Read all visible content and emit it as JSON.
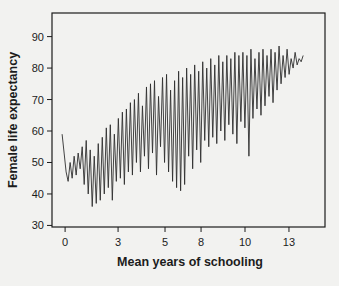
{
  "page": {
    "background": "#f2f2f0",
    "text_color": "#1c1c1c"
  },
  "chart_data": {
    "type": "line",
    "title": "",
    "xlabel": "Mean years of schooling",
    "ylabel": "Female life expectancy",
    "grid": false,
    "legend": "none",
    "line_color": "#2f2f2f",
    "axis_color": "#1c1c1c",
    "x_axis": {
      "tick_labels": [
        "0",
        "3",
        "5",
        "8",
        "10",
        "13"
      ],
      "tick_positions_frac": [
        0.048,
        0.242,
        0.414,
        0.546,
        0.707,
        0.868
      ],
      "scale_note": "categorical axis: one position per case sorted by schooling, ticks at labeled values"
    },
    "y_axis": {
      "tick_values": [
        30,
        40,
        50,
        60,
        70,
        80,
        90
      ],
      "ylim": [
        29.5,
        97.5
      ]
    },
    "series": [
      {
        "name": "Female life expectancy per case (cases ordered by mean years of schooling)",
        "start_frac": 0.037,
        "end_frac": 0.92,
        "values": [
          59,
          53,
          47,
          44,
          50,
          45,
          52,
          46,
          53,
          48,
          55,
          43,
          57,
          40,
          54,
          36,
          52,
          37,
          56,
          38,
          58,
          40,
          61,
          42,
          62,
          38,
          59,
          44,
          64,
          45,
          66,
          43,
          67,
          47,
          69,
          46,
          70,
          50,
          72,
          47,
          68,
          52,
          74,
          48,
          75,
          53,
          76,
          46,
          71,
          55,
          77,
          50,
          78,
          47,
          73,
          44,
          76,
          42,
          79,
          41,
          77,
          43,
          80,
          52,
          78,
          48,
          81,
          54,
          79,
          50,
          82,
          57,
          80,
          55,
          83,
          58,
          81,
          56,
          84,
          60,
          82,
          57,
          84,
          62,
          83,
          59,
          85,
          56,
          84,
          63,
          85,
          61,
          84,
          52,
          86,
          64,
          83,
          67,
          85,
          65,
          86,
          68,
          84,
          71,
          86,
          69,
          85,
          73,
          87,
          75,
          84,
          77,
          86,
          78,
          83,
          80,
          85,
          81,
          83,
          82,
          84
        ]
      }
    ]
  }
}
